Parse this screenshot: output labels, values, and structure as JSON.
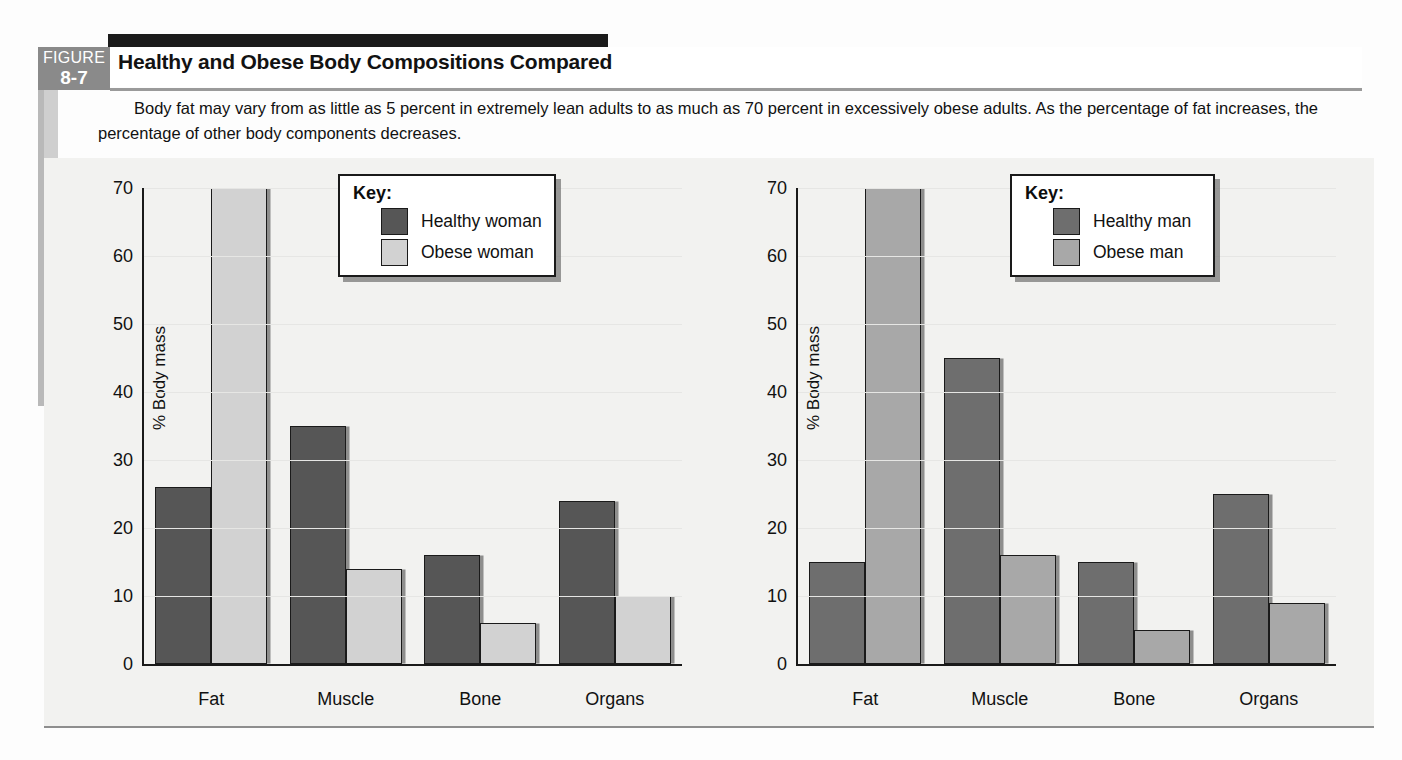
{
  "figure": {
    "label_word": "FIGURE",
    "number": "8-7",
    "title": "Healthy and Obese Body Compositions Compared",
    "caption": "Body fat may vary from as little as 5 percent in extremely lean adults to as much as 70 percent in excessively obese adults. As the percentage of fat increases, the percentage of other body components decreases."
  },
  "colors": {
    "healthy_woman": "#565656",
    "obese_woman": "#d2d2d2",
    "healthy_man": "#6e6e6e",
    "obese_man": "#a8a8a8",
    "axis": "#1a1a1a",
    "figure_block": "#8a8a8a",
    "panel_background": "#f2f2f0"
  },
  "chart_data": [
    {
      "type": "bar",
      "title": "",
      "xlabel": "",
      "ylabel": "% Body mass",
      "ylim": [
        0,
        70
      ],
      "yticks": [
        0,
        10,
        20,
        30,
        40,
        50,
        60,
        70
      ],
      "grid": true,
      "legend_position": "top-right",
      "legend_title": "Key:",
      "categories": [
        "Fat",
        "Muscle",
        "Bone",
        "Organs"
      ],
      "series": [
        {
          "name": "Healthy woman",
          "color": "#565656",
          "values": [
            26,
            35,
            16,
            24
          ]
        },
        {
          "name": "Obese woman",
          "color": "#d2d2d2",
          "values": [
            70,
            14,
            6,
            10
          ]
        }
      ]
    },
    {
      "type": "bar",
      "title": "",
      "xlabel": "",
      "ylabel": "% Body mass",
      "ylim": [
        0,
        70
      ],
      "yticks": [
        0,
        10,
        20,
        30,
        40,
        50,
        60,
        70
      ],
      "grid": true,
      "legend_position": "top-right",
      "legend_title": "Key:",
      "categories": [
        "Fat",
        "Muscle",
        "Bone",
        "Organs"
      ],
      "series": [
        {
          "name": "Healthy man",
          "color": "#6e6e6e",
          "values": [
            15,
            45,
            15,
            25
          ]
        },
        {
          "name": "Obese man",
          "color": "#a8a8a8",
          "values": [
            70,
            16,
            5,
            9
          ]
        }
      ]
    }
  ]
}
